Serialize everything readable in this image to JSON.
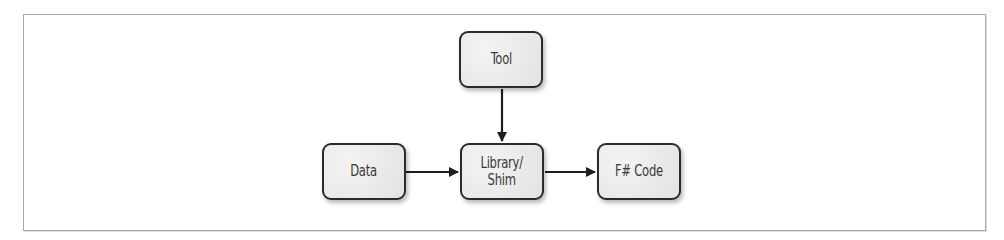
{
  "diagram": {
    "type": "flow",
    "nodes": [
      {
        "id": "tool",
        "label": "Tool"
      },
      {
        "id": "data",
        "label": "Data"
      },
      {
        "id": "library",
        "label": "Library/\nShim"
      },
      {
        "id": "fsharp",
        "label": "F# Code"
      }
    ],
    "edges": [
      {
        "from": "tool",
        "to": "library",
        "direction": "down"
      },
      {
        "from": "data",
        "to": "library",
        "direction": "right"
      },
      {
        "from": "library",
        "to": "fsharp",
        "direction": "right"
      }
    ],
    "colors": {
      "node_border": "#2b2b2b",
      "node_fill": "#ececec",
      "text": "#3a3a3a",
      "arrow": "#1e1e1e",
      "frame": "#a8a8a8"
    }
  }
}
